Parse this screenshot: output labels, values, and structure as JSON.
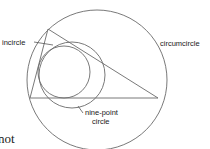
{
  "diagram": {
    "labels": {
      "incircle": "incircle",
      "circumcircle": "circumcircle",
      "nine_point_line1": "nine-point",
      "nine_point_line2": "circle"
    },
    "text_fragment": "not",
    "colors": {
      "line": "#6a6a6a",
      "text": "#1a1a1a",
      "background": "#ffffff"
    }
  }
}
